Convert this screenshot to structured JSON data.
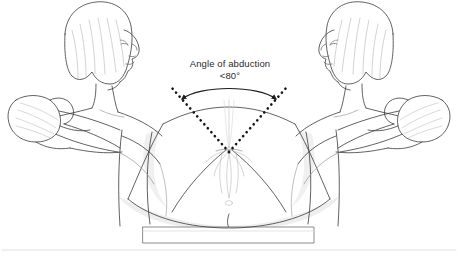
{
  "figure": {
    "kind": "medical-line-illustration",
    "topic": "Hip abduction examination of supine patient by two examiners",
    "background_color": "#ffffff",
    "line_color": "#3a3a3a",
    "shade_color": "#eeeeee",
    "text_color": "#2b2b2b"
  },
  "annotations": {
    "angle_label_line1": "Angle of abduction",
    "angle_label_line2": "<80°"
  },
  "markers": {
    "dotted_guide_left": "dotted-line-left-thigh-axis",
    "dotted_guide_right": "dotted-line-right-thigh-axis",
    "arc_arrow": "double-headed-arc-arrow-abduction-span",
    "apex": "angle-apex-at-pelvis"
  },
  "subjects": {
    "examiner_left": "examiner-figure-left-facing-right",
    "examiner_right": "examiner-figure-right-facing-left",
    "patient": "supine-patient-with-abducted-hips",
    "table": "examination-table"
  }
}
